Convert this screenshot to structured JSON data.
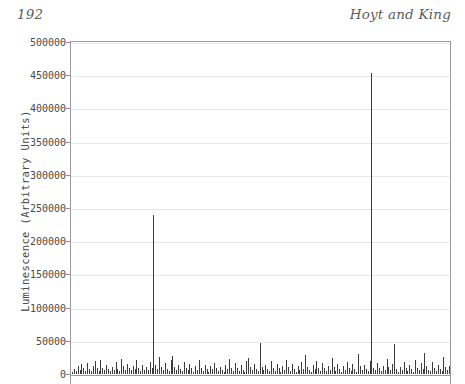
{
  "header": {
    "folio": "192",
    "running_title": "Hoyt and King"
  },
  "figure": {
    "y_axis_title": "Luminescence (Arbitrary Units)",
    "colors": {
      "bar": "#3b3b3b",
      "axis": "#9a9a9a",
      "gridline": "#e8e8e8",
      "text": "#4a4a4a",
      "header_text": "#5c5c5c"
    }
  },
  "chart_data": {
    "type": "bar",
    "title": "",
    "xlabel": "",
    "ylabel": "Luminescence (Arbitrary Units)",
    "ylim": [
      0,
      500000
    ],
    "ytick_labels": [
      "500000",
      "450000",
      "400000",
      "350000",
      "300000",
      "250000",
      "200000",
      "150000",
      "100000",
      "50000",
      "0"
    ],
    "yticks": [
      500000,
      450000,
      400000,
      350000,
      300000,
      250000,
      200000,
      150000,
      100000,
      50000,
      0
    ],
    "grid": true,
    "legend": false,
    "xaxis_visible": false,
    "xtick_labels": [],
    "values": [
      3000,
      8200,
      4100,
      11500,
      6400,
      14800,
      9100,
      5200,
      16200,
      7300,
      4400,
      12100,
      19500,
      8600,
      5100,
      21000,
      9800,
      6200,
      13400,
      7700,
      3900,
      10200,
      5600,
      17800,
      8300,
      4700,
      22500,
      11900,
      6800,
      15100,
      9400,
      5300,
      12700,
      7100,
      20400,
      8900,
      4200,
      14300,
      6600,
      10800,
      5900,
      18600,
      9200,
      240000,
      13900,
      7400,
      25800,
      11200,
      5700,
      16900,
      8100,
      4600,
      21700,
      27400,
      10500,
      6100,
      13100,
      7900,
      4300,
      18200,
      9700,
      5400,
      15600,
      8700,
      3700,
      11600,
      6300,
      20900,
      9000,
      4900,
      14100,
      7600,
      3400,
      12400,
      6900,
      17300,
      8400,
      4100,
      10100,
      5800,
      3100,
      13700,
      7200,
      22100,
      9500,
      5000,
      16400,
      8800,
      4500,
      12900,
      6700,
      3300,
      19800,
      24600,
      11000,
      5500,
      14900,
      8000,
      3800,
      47200,
      10400,
      6000,
      13500,
      7800,
      4000,
      18900,
      9300,
      5200,
      15800,
      8500,
      3600,
      11800,
      6500,
      21300,
      9900,
      4800,
      14600,
      7500,
      3200,
      12200,
      6100,
      17600,
      8200,
      28900,
      10700,
      5700,
      3500,
      13800,
      7000,
      20100,
      9600,
      4400,
      16100,
      8600,
      3900,
      11400,
      6200,
      23800,
      10000,
      5100,
      14400,
      7700,
      3000,
      12600,
      6800,
      18400,
      9100,
      4700,
      15300,
      8300,
      3700,
      30100,
      11700,
      6400,
      13200,
      7300,
      4200,
      19200,
      453000,
      9400,
      5600,
      16700,
      8900,
      4000,
      12000,
      6600,
      22800,
      10300,
      5300,
      14700,
      45100,
      7900,
      3400,
      11300,
      6000,
      17900,
      8700,
      4500,
      13600,
      7200,
      3100,
      20600,
      9800,
      5400,
      15900,
      8100,
      31600,
      12500,
      6700,
      4100,
      18100,
      9000,
      5000,
      14200,
      7600,
      3800,
      26300,
      10900,
      6300,
      12800
    ]
  }
}
